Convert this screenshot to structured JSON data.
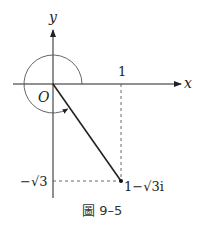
{
  "diagram": {
    "axis_labels": {
      "x": "x",
      "y": "y",
      "origin": "O"
    },
    "tick_labels": {
      "x_one": "1",
      "y_neg_sqrt3": "−√3"
    },
    "point_label": "1−√3i",
    "caption": "圖 9–5",
    "colors": {
      "line": "#222222",
      "arc": "#555555",
      "dash": "#444444"
    }
  }
}
